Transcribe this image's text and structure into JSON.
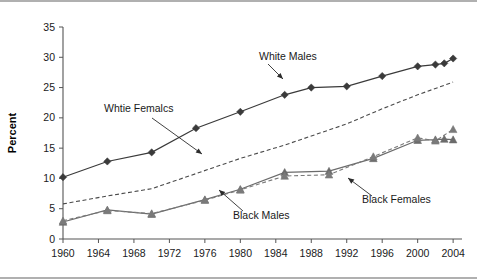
{
  "chart_data": {
    "type": "line",
    "title": "",
    "xlabel": "",
    "ylabel": "Percent",
    "xlim": [
      1960,
      2005
    ],
    "ylim": [
      0,
      35
    ],
    "yticks": [
      0,
      5,
      10,
      15,
      20,
      25,
      30,
      35
    ],
    "xticks": [
      1960,
      1964,
      1968,
      1972,
      1976,
      1980,
      1984,
      1988,
      1992,
      1996,
      2000,
      2004
    ],
    "grid": false,
    "legend_position": "inline-annotations",
    "series": [
      {
        "name": "White Males",
        "style": "solid",
        "marker": "diamond",
        "color": "#3a3a3a",
        "x": [
          1960,
          1965,
          1970,
          1975,
          1980,
          1985,
          1988,
          1992,
          1996,
          2000,
          2002,
          2003,
          2004
        ],
        "values": [
          10.2,
          12.8,
          14.3,
          18.3,
          21.0,
          23.8,
          25.0,
          25.2,
          26.9,
          28.5,
          28.8,
          29.0,
          29.8
        ]
      },
      {
        "name": "Whtie Femalcs",
        "style": "dashed",
        "marker": "none",
        "color": "#4a4a4a",
        "x": [
          1960,
          1965,
          1970,
          1975,
          1980,
          1985,
          1988,
          1992,
          1996,
          2000,
          2004
        ],
        "values": [
          5.8,
          7.1,
          8.3,
          10.8,
          13.3,
          15.5,
          17.0,
          19.0,
          21.5,
          23.8,
          25.9
        ]
      },
      {
        "name": "Black Males",
        "style": "solid",
        "marker": "triangle",
        "color": "#6b6b6b",
        "x": [
          1960,
          1965,
          1970,
          1976,
          1980,
          1985,
          1990,
          1995,
          2000,
          2002,
          2003,
          2004
        ],
        "values": [
          2.8,
          4.8,
          4.1,
          6.5,
          8.2,
          11.0,
          11.2,
          13.3,
          16.3,
          16.4,
          16.5,
          16.4
        ]
      },
      {
        "name": "Black Females",
        "style": "dashed",
        "marker": "triangle",
        "color": "#7a7a7a",
        "x": [
          1960,
          1965,
          1970,
          1976,
          1980,
          1985,
          1990,
          1995,
          2000,
          2002,
          2004
        ],
        "values": [
          3.0,
          4.7,
          4.2,
          6.4,
          8.1,
          10.4,
          10.6,
          13.6,
          16.7,
          16.2,
          18.1
        ]
      }
    ],
    "annotations": [
      {
        "label": "White Males",
        "text_x": 259,
        "text_y": 58,
        "arrow": [
          [
            268,
            62
          ],
          [
            283,
            77
          ]
        ]
      },
      {
        "label": "Whtie Femalcs",
        "text_x": 104,
        "text_y": 110,
        "arrow": [
          [
            152,
            116
          ],
          [
            202,
            152
          ]
        ]
      },
      {
        "label": "Black Males",
        "text_x": 233,
        "text_y": 217,
        "arrow": [
          [
            243,
            209
          ],
          [
            219,
            188
          ]
        ]
      },
      {
        "label": "Black Females",
        "text_x": 362,
        "text_y": 201,
        "arrow": [
          [
            372,
            194
          ],
          [
            348,
            176
          ]
        ]
      }
    ]
  }
}
